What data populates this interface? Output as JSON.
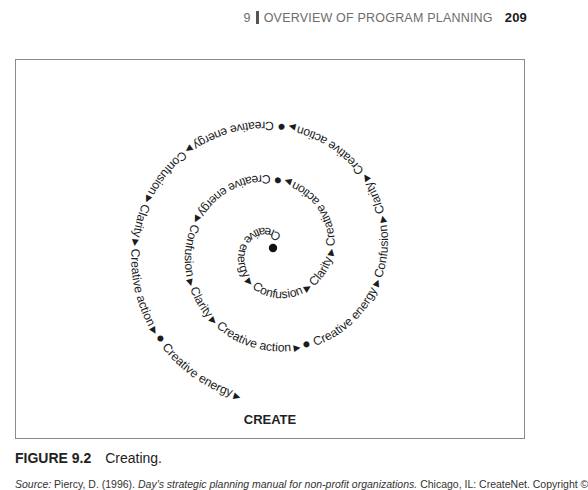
{
  "running_head": {
    "chapter_number": "9",
    "chapter_title": "OVERVIEW OF PROGRAM PLANNING",
    "page_number": "209"
  },
  "figure": {
    "center_label": "CREATE",
    "spiral": {
      "marker_symbols": {
        "arrow": "▶",
        "dot": "●"
      },
      "cycle": [
        "Creative energy",
        "Confusion",
        "Clarity",
        "Creative action"
      ],
      "sequence": [
        {
          "type": "dot"
        },
        {
          "type": "text",
          "value": "Creative energy"
        },
        {
          "type": "arrow"
        },
        {
          "type": "text",
          "value": "Confusion"
        },
        {
          "type": "arrow"
        },
        {
          "type": "text",
          "value": "Clarity"
        },
        {
          "type": "arrow"
        },
        {
          "type": "text",
          "value": "Creative action"
        },
        {
          "type": "arrow"
        },
        {
          "type": "dot"
        },
        {
          "type": "text",
          "value": "Creative energy"
        },
        {
          "type": "arrow"
        },
        {
          "type": "text",
          "value": "Confusion"
        },
        {
          "type": "arrow"
        },
        {
          "type": "text",
          "value": "Clarity"
        },
        {
          "type": "arrow"
        },
        {
          "type": "text",
          "value": "Creative action"
        },
        {
          "type": "arrow"
        },
        {
          "type": "dot"
        },
        {
          "type": "text",
          "value": "Creative energy"
        },
        {
          "type": "arrow"
        },
        {
          "type": "text",
          "value": "Confusion"
        },
        {
          "type": "arrow"
        },
        {
          "type": "text",
          "value": "Clarity"
        },
        {
          "type": "arrow"
        },
        {
          "type": "text",
          "value": "Creative action"
        },
        {
          "type": "arrow"
        },
        {
          "type": "dot"
        },
        {
          "type": "text",
          "value": "Creative energy"
        },
        {
          "type": "arrow"
        },
        {
          "type": "text",
          "value": "Confusion"
        },
        {
          "type": "arrow"
        },
        {
          "type": "text",
          "value": "Clarity"
        },
        {
          "type": "arrow"
        },
        {
          "type": "text",
          "value": "Creative action"
        },
        {
          "type": "arrow"
        },
        {
          "type": "dot"
        },
        {
          "type": "text",
          "value": "Creative energy"
        },
        {
          "type": "arrow"
        }
      ]
    }
  },
  "caption": {
    "figure_number": "FIGURE 9.2",
    "title": "Creating."
  },
  "source": {
    "prefix": "Source:",
    "authors": "Piercy, D. (1996).",
    "book_title": "Day's strategic planning manual for non-profit organizations.",
    "publisher": "Chicago, IL: CreateNet. Copyright ©"
  }
}
